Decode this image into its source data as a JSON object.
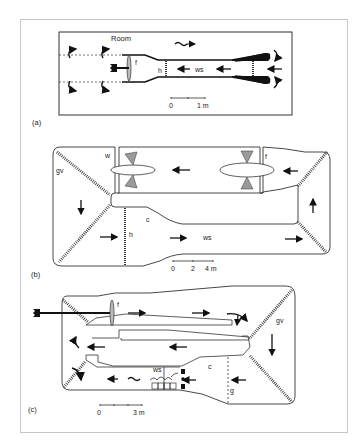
{
  "figure": {
    "panels": [
      {
        "id": "a",
        "panel_label": "(a)",
        "labels": {
          "room": "Room",
          "fan": "f",
          "honeycomb": "h",
          "working_section": "ws"
        },
        "scale_bar": {
          "start": "0",
          "end": "1 m"
        }
      },
      {
        "id": "b",
        "panel_label": "(b)",
        "labels": {
          "guide_vanes": "gv",
          "wall": "w",
          "fan": "f",
          "contraction": "c",
          "honeycomb": "h",
          "working_section": "ws"
        },
        "scale_bar": {
          "start": "0",
          "mid": "2",
          "end": "4 m"
        }
      },
      {
        "id": "c",
        "panel_label": "(c)",
        "labels": {
          "fan": "f",
          "guide_vanes": "gv",
          "working_section": "ws",
          "contraction": "c",
          "grid": "g"
        },
        "scale_bar": {
          "start": "0",
          "end": "3 m"
        }
      }
    ],
    "colors": {
      "line": "#333333",
      "fill_dark": "#111111",
      "fill_grey": "#9a9a9a",
      "frame": "#c8c8c8"
    }
  }
}
